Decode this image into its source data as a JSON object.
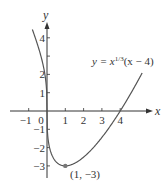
{
  "chart_data": {
    "type": "line",
    "title": "",
    "function": "y = x^(1/3)(x - 4)",
    "xlabel": "x",
    "ylabel": "y",
    "xlim": [
      -1.0,
      5.8
    ],
    "ylim": [
      -3.4,
      4.8
    ],
    "x_ticks": [
      -1,
      0,
      1,
      2,
      3,
      4
    ],
    "x_tick_labels": [
      "−1",
      "0",
      "1",
      "2",
      "3",
      "4"
    ],
    "y_ticks": [
      -3,
      -2,
      -1,
      1,
      2,
      4
    ],
    "y_tick_labels": [
      "−3",
      "−2",
      "−1",
      "1",
      "2",
      "4"
    ],
    "y_minor_ticks": [
      3
    ],
    "grid": false,
    "series": [
      {
        "name": "y = x^(1/3)(x − 4)",
        "x_range": [
          -0.8,
          5.2
        ],
        "color": "#555555"
      }
    ],
    "annotations": [
      {
        "text": "(1, −3)",
        "x": 1,
        "y": -3,
        "marker": "dot"
      },
      {
        "text": "y = x^(1/3)(x − 4)",
        "position": "upper-right"
      }
    ]
  },
  "labels": {
    "x_axis": "x",
    "y_axis": "y",
    "equation_prefix": "y = x",
    "equation_exp": "1/3",
    "equation_suffix": "(x − 4)",
    "point": "(1, −3)",
    "origin": "0"
  },
  "colors": {
    "axis": "#333333",
    "curve": "#555555",
    "point": "#777777"
  }
}
